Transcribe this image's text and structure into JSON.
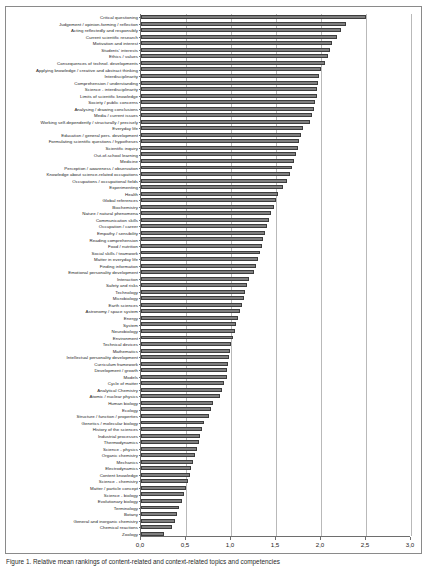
{
  "chart_data": {
    "type": "bar",
    "orientation": "horizontal",
    "title": "",
    "xlabel": "",
    "ylabel": "",
    "xlim": [
      0.0,
      3.0
    ],
    "xticks": [
      "0,0",
      "0,5",
      "1,0",
      "1,5",
      "2,0",
      "2,5",
      "3,0"
    ],
    "xtick_values": [
      0.0,
      0.5,
      1.0,
      1.5,
      2.0,
      2.5,
      3.0
    ],
    "grid": true,
    "grid_axis": "x",
    "legend": null,
    "bar_color": "#7f7f7f",
    "bar_edge_color": "#3d3d3d",
    "categories": [
      "Critical questioning",
      "Judgement / opinion-forming / reflection",
      "Acting reflectedly and responsibly",
      "Current scientific research",
      "Motivation and interest",
      "Students' interests",
      "Ethics / values",
      "Consequences of technol. developments",
      "Applying knowledge / creative and abstract thinking",
      "Interdisciplinarity",
      "Comprehension / understanding",
      "Science - interdisciplinarity",
      "Limits of scientific knowledge",
      "Society / public concerns",
      "Analysing / drawing conclusions",
      "Media / current issues",
      "Working self-dependently / structurally / precisely",
      "Everyday life",
      "Education / general pers. development",
      "Formulating scientific questions / hypotheses",
      "Scientific inquiry",
      "Out-of-school learning",
      "Medicine",
      "Perception / awareness / observation",
      "Knowledge about science-related occupations",
      "Occupations / occupational fields",
      "Experimenting",
      "Health",
      "Global references",
      "Biochemistry",
      "Nature / natural phenomena",
      "Communication skills",
      "Occupation / career",
      "Empathy / sensibility",
      "Reading comprehension",
      "Food / nutrition",
      "Social skills / teamwork",
      "Matter in everyday life",
      "Finding information",
      "Emotional personality development",
      "Interaction",
      "Safety and risks",
      "Technology",
      "Microbiology",
      "Earth sciences",
      "Astronomy / space system",
      "Energy",
      "System",
      "Neurobiology",
      "Environment",
      "Technical devices",
      "Mathematics",
      "Intellectual personality development",
      "Curriculum framework",
      "Development / growth",
      "Models",
      "Cycle of matter",
      "Analytical Chemistry",
      "Atomic / nuclear physics",
      "Human biology",
      "Ecology",
      "Structure / function / properties",
      "Genetics / molecular biology",
      "History of the sciences",
      "Industrial processes",
      "Thermodynamics",
      "Science - physics",
      "Organic chemistry",
      "Mechanics",
      "Electrodynamics",
      "Content knowledge",
      "Science - chemistry",
      "Matter / particle concept",
      "Science - biology",
      "Evolutionary biology",
      "Terminology",
      "Botany",
      "General and inorganic chemistry",
      "Chemical reactions",
      "Zoology"
    ],
    "values": [
      2.5,
      2.28,
      2.22,
      2.18,
      2.12,
      2.1,
      2.08,
      2.04,
      2.0,
      1.98,
      1.97,
      1.96,
      1.95,
      1.93,
      1.92,
      1.9,
      1.88,
      1.8,
      1.78,
      1.76,
      1.74,
      1.72,
      1.7,
      1.68,
      1.66,
      1.62,
      1.58,
      1.52,
      1.5,
      1.48,
      1.44,
      1.42,
      1.4,
      1.38,
      1.36,
      1.34,
      1.32,
      1.3,
      1.28,
      1.26,
      1.2,
      1.18,
      1.16,
      1.14,
      1.12,
      1.1,
      1.08,
      1.06,
      1.04,
      1.02,
      1.0,
      0.99,
      0.98,
      0.97,
      0.96,
      0.95,
      0.92,
      0.9,
      0.88,
      0.8,
      0.78,
      0.76,
      0.7,
      0.68,
      0.66,
      0.64,
      0.62,
      0.6,
      0.58,
      0.56,
      0.54,
      0.52,
      0.5,
      0.48,
      0.46,
      0.42,
      0.4,
      0.38,
      0.34,
      0.26
    ]
  },
  "caption": {
    "text": "Figure 1. Relative mean rankings of content-related and context-related topics and competencies"
  }
}
